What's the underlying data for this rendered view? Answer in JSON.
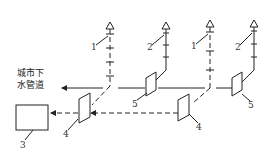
{
  "diagram": {
    "type": "drainage-ventilation-schematic",
    "outlet_label_line1": "城市下",
    "outlet_label_line2": "水管道",
    "labels": {
      "vent1_left": "1",
      "vent2_mid": "2",
      "vent1_right": "1",
      "vent2_right": "2",
      "box3": "3",
      "trap4_left": "4",
      "trap4_right": "4",
      "trap5_mid": "5",
      "trap5_right": "5"
    },
    "legend_meaning": {
      "solid_line": "drain pipe",
      "dashed_line": "sewer pipe"
    },
    "colors": {
      "line": "#222222",
      "background": "#ffffff"
    }
  }
}
